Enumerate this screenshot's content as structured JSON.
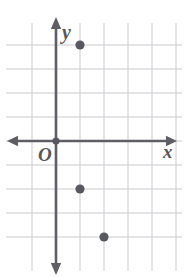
{
  "figure": {
    "background_color": "#ffffff",
    "width": 185,
    "height": 277
  },
  "labels": {
    "x_axis": "x",
    "y_axis": "y",
    "origin": "O"
  },
  "colors": {
    "grid_line": "#c9c9cf",
    "axis_line": "#5e5e64",
    "point_fill": "#585860",
    "label_text": "#585858"
  },
  "chart_data": {
    "type": "scatter",
    "title": "",
    "xlabel": "x",
    "ylabel": "y",
    "grid": true,
    "legend": null,
    "origin_label": "O",
    "grid_spacing_px": 24,
    "origin_px": [
      56,
      141
    ],
    "xlim": [
      -1,
      5
    ],
    "ylim": [
      -4,
      4
    ],
    "x_ticks": [
      -1,
      0,
      1,
      2,
      3,
      4,
      5
    ],
    "y_ticks": [
      -4,
      -3,
      -2,
      -1,
      0,
      1,
      2,
      3,
      4
    ],
    "tick_labels_shown": false,
    "points": [
      {
        "x": 1,
        "y": 4,
        "px": [
          80,
          45
        ]
      },
      {
        "x": 1,
        "y": -2,
        "px": [
          80,
          189
        ]
      },
      {
        "x": 2,
        "y": -4,
        "px": [
          104,
          237
        ]
      }
    ],
    "vertical_gridlines_px": [
      32,
      56,
      80,
      104,
      128,
      152,
      176
    ],
    "horizontal_gridlines_px": [
      45,
      69,
      93,
      117,
      141,
      165,
      189,
      213,
      237
    ],
    "axes": {
      "x_axis_y_px": 141,
      "x_axis_from_px": 10,
      "x_axis_to_px": 174,
      "x_arrows": [
        "left",
        "right"
      ],
      "y_axis_x_px": 56,
      "y_axis_from_px": 20,
      "y_axis_to_px": 272,
      "y_arrows": [
        "up",
        "down"
      ]
    }
  }
}
